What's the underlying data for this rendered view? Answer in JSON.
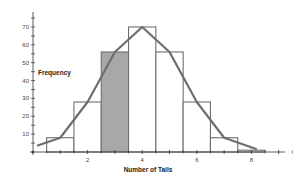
{
  "chart_data": {
    "type": "bar",
    "title": "",
    "xlabel": "Number of Tails",
    "ylabel": "Frequency",
    "categories": [
      "0",
      "1",
      "2",
      "3",
      "4",
      "5",
      "6",
      "7",
      "8"
    ],
    "values": [
      1,
      8,
      28,
      56,
      70,
      56,
      28,
      8,
      1
    ],
    "highlighted_category": "3",
    "overlay": {
      "type": "line",
      "name": "frequency polygon",
      "values": [
        1,
        8,
        28,
        56,
        70,
        56,
        28,
        8,
        1
      ]
    },
    "xlim": [
      0,
      9
    ],
    "ylim": [
      0,
      75
    ],
    "x_ticks": [
      "2",
      "4",
      "6",
      "8"
    ],
    "y_ticks": [
      "10",
      "20",
      "30",
      "40",
      "50",
      "60",
      "70"
    ],
    "grid": false,
    "colors": {
      "bar_fill": "#ffffff",
      "highlight_fill": "#a8a8a8",
      "bar_stroke": "#6e6e6e",
      "line": "#6e6e6e",
      "axis": "#333333"
    }
  }
}
